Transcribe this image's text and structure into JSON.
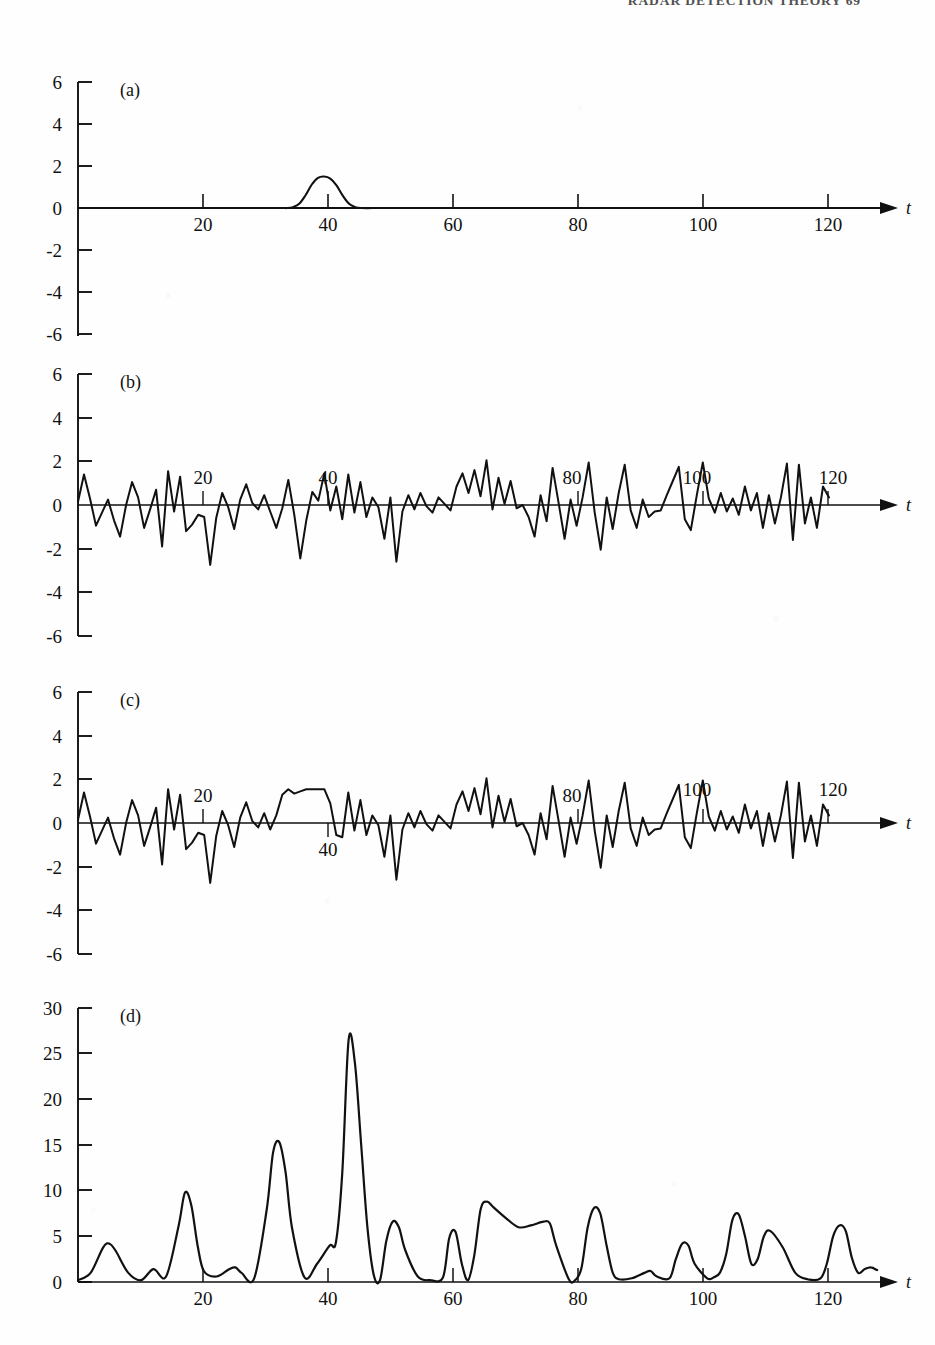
{
  "page": {
    "running_head": "RADAR DETECTION THEORY   69",
    "width": 935,
    "height": 1345,
    "background": "#ffffff",
    "ink_color": "#111111"
  },
  "figure": {
    "type": "multi-panel-line-plot",
    "panel_count": 4,
    "shared_x_label": "t",
    "x_range": [
      0,
      130
    ]
  },
  "panels": {
    "a": {
      "tag": "(a)",
      "y_ticks": [
        "6",
        "4",
        "2",
        "0",
        "-2",
        "-4",
        "-6"
      ],
      "x_ticks": [
        "20",
        "40",
        "60",
        "80",
        "100",
        "120"
      ],
      "x_label": "t",
      "x_tick_label_side": "below"
    },
    "b": {
      "tag": "(b)",
      "y_ticks": [
        "6",
        "4",
        "2",
        "0",
        "-2",
        "-4",
        "-6"
      ],
      "x_ticks": [
        "20",
        "40",
        "80",
        "100",
        "120"
      ],
      "x_label": "t",
      "x_tick_label_side": "above"
    },
    "c": {
      "tag": "(c)",
      "y_ticks": [
        "6",
        "4",
        "2",
        "0",
        "-2",
        "-4",
        "-6"
      ],
      "x_ticks": [
        "20",
        "40",
        "80",
        "100",
        "120"
      ],
      "x_label": "t",
      "x_tick_label_side": "mixed"
    },
    "d": {
      "tag": "(d)",
      "y_ticks": [
        "30",
        "25",
        "20",
        "15",
        "10",
        "5",
        "0"
      ],
      "x_ticks": [
        "20",
        "40",
        "60",
        "80",
        "100",
        "120"
      ],
      "x_label": "t",
      "x_tick_label_side": "below"
    }
  },
  "chart_data": [
    {
      "type": "line",
      "id": "panel-a",
      "title": "(a)",
      "xlabel": "t",
      "ylabel": "",
      "xlim": [
        0,
        130
      ],
      "ylim": [
        -6,
        6
      ],
      "yticks": [
        -6,
        -4,
        -2,
        0,
        2,
        4,
        6
      ],
      "xticks": [
        20,
        40,
        60,
        80,
        100,
        120
      ],
      "grid": false,
      "legend": false,
      "description": "Transmitted/reference signal pulse: a single smooth bump centred at t = 40, peak amplitude about 1.5, zero elsewhere.",
      "x": [
        0,
        30,
        34,
        35,
        36,
        37,
        38,
        39,
        40,
        41,
        42,
        43,
        44,
        45,
        46,
        50,
        60,
        80,
        100,
        120,
        128
      ],
      "y": [
        0,
        0,
        0,
        0.05,
        0.22,
        0.62,
        1.12,
        1.44,
        1.5,
        1.4,
        1.08,
        0.6,
        0.22,
        0.05,
        0,
        0,
        0,
        0,
        0,
        0,
        0
      ]
    },
    {
      "type": "line",
      "id": "panel-b",
      "title": "(b)",
      "xlabel": "t",
      "ylabel": "",
      "xlim": [
        0,
        130
      ],
      "ylim": [
        -6,
        6
      ],
      "yticks": [
        -6,
        -4,
        -2,
        0,
        2,
        4,
        6
      ],
      "xticks": [
        20,
        40,
        80,
        100,
        120
      ],
      "grid": false,
      "legend": false,
      "description": "Noise only: band-limited random noise, roughly zero mean, excursions mostly within +/-2.5.",
      "x": [
        0,
        1,
        2,
        3,
        4,
        5,
        6,
        7,
        8,
        9,
        10,
        11,
        12,
        13,
        14,
        15,
        16,
        17,
        18,
        19,
        20,
        21,
        22,
        23,
        24,
        25,
        26,
        27,
        28,
        29,
        30,
        31,
        32,
        33,
        34,
        35,
        36,
        37,
        38,
        39,
        40,
        41,
        42,
        43,
        44,
        45,
        46,
        47,
        48,
        49,
        50,
        51,
        52,
        53,
        54,
        55,
        56,
        57,
        58,
        59,
        60,
        61,
        62,
        63,
        64,
        65,
        66,
        67,
        68,
        69,
        70,
        71,
        72,
        73,
        74,
        75,
        76,
        77,
        78,
        79,
        80,
        81,
        82,
        83,
        84,
        85,
        86,
        87,
        88,
        89,
        90,
        91,
        92,
        93,
        94,
        95,
        96,
        97,
        98,
        99,
        100,
        101,
        102,
        103,
        104,
        105,
        106,
        107,
        108,
        109,
        110,
        111,
        112,
        113,
        114,
        115,
        116,
        117,
        118,
        119,
        120,
        121,
        122,
        123,
        124,
        125,
        126,
        127
      ],
      "y": [
        0.15,
        1.4,
        0.3,
        -0.95,
        -0.35,
        0.25,
        -0.7,
        -1.45,
        0.0,
        1.05,
        0.35,
        -1.05,
        -0.2,
        0.7,
        -1.9,
        1.55,
        -0.3,
        1.3,
        -1.2,
        -0.9,
        -0.45,
        -0.55,
        -2.75,
        -0.6,
        0.55,
        -0.1,
        -1.1,
        0.25,
        0.95,
        0.1,
        -0.2,
        0.45,
        -0.3,
        -1.05,
        -0.15,
        1.15,
        -0.45,
        -2.45,
        -0.7,
        0.6,
        0.2,
        1.45,
        -0.25,
        0.85,
        -0.65,
        1.4,
        -0.35,
        1.05,
        -0.55,
        0.35,
        -0.1,
        -1.55,
        0.35,
        -2.6,
        -0.3,
        0.45,
        -0.2,
        0.55,
        -0.05,
        -0.35,
        0.35,
        0.05,
        -0.25,
        0.85,
        1.45,
        0.55,
        1.6,
        0.4,
        2.05,
        -0.2,
        1.25,
        0.05,
        1.1,
        -0.15,
        0.0,
        -0.55,
        -1.45,
        0.45,
        -0.75,
        1.7,
        0.1,
        -1.55,
        0.25,
        -0.95,
        0.35,
        1.95,
        -0.35,
        -2.05,
        0.35,
        -1.1,
        0.55,
        1.85,
        -0.25,
        -1.05,
        0.25,
        -0.55,
        -0.3,
        -0.25,
        0.45,
        1.1,
        1.75,
        -0.65,
        -1.15,
        0.45,
        1.95,
        0.3,
        -0.35,
        0.55,
        -0.3,
        0.3,
        -0.45,
        0.85,
        -0.25,
        0.55,
        -1.05,
        0.45,
        -0.85,
        0.35,
        1.9,
        -1.6,
        1.85,
        -0.85,
        0.35,
        -1.05,
        0.85,
        0.35
      ],
      "y_range_observed": [
        -2.8,
        2.1
      ]
    },
    {
      "type": "line",
      "id": "panel-c",
      "title": "(c)",
      "xlabel": "t",
      "ylabel": "",
      "xlim": [
        0,
        130
      ],
      "ylim": [
        -6,
        6
      ],
      "yticks": [
        -6,
        -4,
        -2,
        0,
        2,
        4,
        6
      ],
      "xticks": [
        20,
        40,
        80,
        100,
        120
      ],
      "grid": false,
      "legend": false,
      "description": "Signal plus noise: same noise record as (b) with the (a) pulse added near t = 38-43, visible as a raised plateau around +1.5.",
      "x": [
        0,
        1,
        2,
        3,
        4,
        5,
        6,
        7,
        8,
        9,
        10,
        11,
        12,
        13,
        14,
        15,
        16,
        17,
        18,
        19,
        20,
        21,
        22,
        23,
        24,
        25,
        26,
        27,
        28,
        29,
        30,
        31,
        32,
        33,
        34,
        35,
        36,
        37,
        38,
        39,
        40,
        41,
        42,
        43,
        44,
        45,
        46,
        47,
        48,
        49,
        50,
        51,
        52,
        53,
        54,
        55,
        56,
        57,
        58,
        59,
        60,
        61,
        62,
        63,
        64,
        65,
        66,
        67,
        68,
        69,
        70,
        71,
        72,
        73,
        74,
        75,
        76,
        77,
        78,
        79,
        80,
        81,
        82,
        83,
        84,
        85,
        86,
        87,
        88,
        89,
        90,
        91,
        92,
        93,
        94,
        95,
        96,
        97,
        98,
        99,
        100,
        101,
        102,
        103,
        104,
        105,
        106,
        107,
        108,
        109,
        110,
        111,
        112,
        113,
        114,
        115,
        116,
        117,
        118,
        119,
        120,
        121,
        122,
        123,
        124,
        125,
        126,
        127
      ],
      "y": [
        0.15,
        1.4,
        0.3,
        -0.95,
        -0.35,
        0.25,
        -0.7,
        -1.45,
        0.0,
        1.05,
        0.35,
        -1.05,
        -0.2,
        0.7,
        -1.9,
        1.55,
        -0.3,
        1.3,
        -1.2,
        -0.9,
        -0.45,
        -0.55,
        -2.75,
        -0.6,
        0.55,
        -0.1,
        -1.1,
        0.25,
        0.95,
        0.1,
        -0.2,
        0.45,
        -0.3,
        0.35,
        1.3,
        1.55,
        1.35,
        1.45,
        1.55,
        1.55,
        1.55,
        1.55,
        0.9,
        -0.55,
        -0.65,
        1.4,
        -0.35,
        1.05,
        -0.55,
        0.35,
        -0.1,
        -1.55,
        0.35,
        -2.6,
        -0.3,
        0.45,
        -0.2,
        0.55,
        -0.05,
        -0.35,
        0.35,
        0.05,
        -0.25,
        0.85,
        1.45,
        0.55,
        1.6,
        0.4,
        2.05,
        -0.2,
        1.25,
        0.05,
        1.1,
        -0.15,
        0.0,
        -0.55,
        -1.45,
        0.45,
        -0.75,
        1.7,
        0.1,
        -1.55,
        0.25,
        -0.95,
        0.35,
        1.95,
        -0.35,
        -2.05,
        0.35,
        -1.1,
        0.55,
        1.85,
        -0.25,
        -1.05,
        0.25,
        -0.55,
        -0.3,
        -0.25,
        0.45,
        1.1,
        1.75,
        -0.65,
        -1.15,
        0.45,
        1.95,
        0.3,
        -0.35,
        0.55,
        -0.3,
        0.3,
        -0.45,
        0.85,
        -0.25,
        0.55,
        -1.05,
        0.45,
        -0.85,
        0.35,
        1.9,
        -1.6,
        1.85,
        -0.85,
        0.35,
        -1.05,
        0.85,
        0.35
      ],
      "y_range_observed": [
        -2.8,
        2.1
      ]
    },
    {
      "type": "line",
      "id": "panel-d",
      "title": "(d)",
      "xlabel": "t",
      "ylabel": "",
      "xlim": [
        0,
        130
      ],
      "ylim": [
        0,
        30
      ],
      "yticks": [
        0,
        5,
        10,
        15,
        20,
        25,
        30
      ],
      "xticks": [
        20,
        40,
        60,
        80,
        100,
        120
      ],
      "grid": false,
      "legend": false,
      "description": "Matched-filter (correlator) output magnitude for the signal-plus-noise record. Dominant peak of about 26.5 occurs near t = 43, marking the detected target; noise peaks elsewhere stay below about 15.",
      "x": [
        0,
        2,
        4,
        5,
        6,
        8,
        10,
        12,
        14,
        16,
        17,
        18,
        19,
        20,
        22,
        24,
        25,
        26,
        28,
        30,
        31,
        32,
        33,
        34,
        36,
        38,
        40,
        41,
        42,
        43,
        44,
        45,
        46,
        47,
        48,
        49,
        50,
        51,
        52,
        54,
        56,
        58,
        59,
        60,
        61,
        62,
        63,
        64,
        65,
        66,
        68,
        70,
        72,
        74,
        75,
        76,
        78,
        79,
        80,
        81,
        82,
        83,
        84,
        85,
        86,
        88,
        90,
        91,
        92,
        94,
        95,
        96,
        97,
        98,
        100,
        101,
        102,
        103,
        104,
        105,
        106,
        107,
        108,
        109,
        110,
        112,
        114,
        116,
        118,
        119,
        120,
        121,
        122,
        123,
        124,
        125,
        126,
        127
      ],
      "y": [
        0.2,
        1.0,
        3.8,
        4.2,
        3.4,
        1.0,
        0.2,
        1.4,
        0.6,
        6.2,
        9.8,
        8.4,
        4.0,
        1.2,
        0.6,
        1.4,
        1.6,
        1.0,
        0.4,
        8.0,
        14.2,
        15.3,
        12.0,
        6.0,
        0.5,
        2.0,
        4.0,
        4.4,
        12.0,
        26.5,
        24.0,
        15.0,
        6.0,
        0.8,
        0.2,
        4.5,
        6.6,
        6.0,
        3.5,
        0.6,
        0.2,
        0.5,
        4.8,
        5.5,
        2.0,
        0.2,
        3.0,
        8.0,
        8.8,
        8.2,
        7.0,
        6.0,
        6.2,
        6.6,
        6.4,
        4.0,
        0.3,
        0.2,
        1.5,
        6.0,
        8.1,
        7.5,
        4.0,
        1.0,
        0.3,
        0.4,
        1.0,
        1.2,
        0.6,
        0.4,
        2.5,
        4.2,
        4.0,
        2.0,
        0.4,
        0.5,
        1.0,
        3.0,
        6.8,
        7.4,
        5.0,
        2.0,
        2.5,
        5.0,
        5.6,
        3.8,
        1.0,
        0.3,
        0.4,
        2.0,
        5.0,
        6.2,
        5.6,
        2.6,
        1.0,
        1.4,
        1.6,
        1.3
      ],
      "peak": {
        "t": 43,
        "value": 26.5
      }
    }
  ]
}
